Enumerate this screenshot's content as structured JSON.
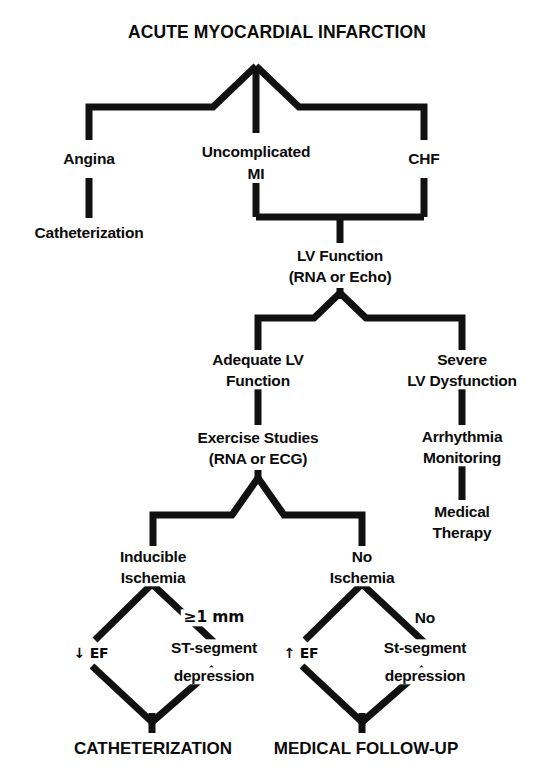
{
  "title": "ACUTE MYOCARDIAL INFARCTION",
  "diagram": {
    "type": "clinical-decision-flowchart",
    "stroke_color": "#111111",
    "background_color": "#ffffff",
    "nodes": {
      "root": "ACUTE MYOCARDIAL INFARCTION",
      "branch_angina": "Angina",
      "branch_uncomplicated_mi": "Uncomplicated\nMI",
      "branch_chf": "CHF",
      "angina_outcome": "Catheterization",
      "lv_function": "LV Function\n(RNA or Echo)",
      "adequate_lv": "Adequate LV\nFunction",
      "severe_lv": "Severe\nLV Dysfunction",
      "exercise_studies": "Exercise Studies\n(RNA or ECG)",
      "arrhythmia_monitoring": "Arrhythmia\nMonitoring",
      "medical_therapy": "Medical\nTherapy",
      "inducible_ischemia": "Inducible\nIschemia",
      "no_ischemia": "No\nIschemia",
      "low_ef": "↓ EF",
      "st_depression": "≥1 mm\nST-segment\ndepression",
      "high_ef": "↑ EF",
      "no_st_depression": "No\nSt-segment\ndepression",
      "terminal_catheterization": "CATHETERIZATION",
      "terminal_medical_followup": "MEDICAL FOLLOW-UP"
    },
    "labels": {
      "root": "ACUTE MYOCARDIAL INFARCTION",
      "angina": "Angina",
      "uncomplicated_mi_line1": "Uncomplicated",
      "uncomplicated_mi_line2": "MI",
      "chf": "CHF",
      "catheterization": "Catheterization",
      "lv_function_line1": "LV Function",
      "lv_function_line2": "(RNA or Echo)",
      "adequate_lv_line1": "Adequate LV",
      "adequate_lv_line2": "Function",
      "severe_lv_line1": "Severe",
      "severe_lv_line2": "LV Dysfunction",
      "exercise_line1": "Exercise Studies",
      "exercise_line2": "(RNA or ECG)",
      "arrhythmia_line1": "Arrhythmia",
      "arrhythmia_line2": "Monitoring",
      "medical_therapy_line1": "Medical",
      "medical_therapy_line2": "Therapy",
      "inducible_line1": "Inducible",
      "inducible_line2": "Ischemia",
      "no_ischemia_line1": "No",
      "no_ischemia_line2": "Ischemia",
      "low_ef": "↓ EF",
      "st_line1": "≥1 mm",
      "st_line2": "ST-segment",
      "st_line3": "depression",
      "high_ef": "↑ EF",
      "no_st_line1": "No",
      "no_st_line2": "St-segment",
      "no_st_line3": "depression",
      "terminal_left": "CATHETERIZATION",
      "terminal_right": "MEDICAL FOLLOW-UP"
    },
    "edges": [
      {
        "from": "root",
        "to": "branch_angina"
      },
      {
        "from": "root",
        "to": "branch_uncomplicated_mi"
      },
      {
        "from": "root",
        "to": "branch_chf"
      },
      {
        "from": "branch_angina",
        "to": "angina_outcome"
      },
      {
        "from": "branch_uncomplicated_mi",
        "to": "lv_function"
      },
      {
        "from": "branch_chf",
        "to": "lv_function"
      },
      {
        "from": "lv_function",
        "to": "adequate_lv"
      },
      {
        "from": "lv_function",
        "to": "severe_lv"
      },
      {
        "from": "adequate_lv",
        "to": "exercise_studies"
      },
      {
        "from": "severe_lv",
        "to": "arrhythmia_monitoring"
      },
      {
        "from": "arrhythmia_monitoring",
        "to": "medical_therapy"
      },
      {
        "from": "exercise_studies",
        "to": "inducible_ischemia"
      },
      {
        "from": "exercise_studies",
        "to": "no_ischemia"
      },
      {
        "from": "inducible_ischemia",
        "to": "low_ef"
      },
      {
        "from": "inducible_ischemia",
        "to": "st_depression"
      },
      {
        "from": "low_ef",
        "to": "terminal_catheterization"
      },
      {
        "from": "st_depression",
        "to": "terminal_catheterization"
      },
      {
        "from": "no_ischemia",
        "to": "high_ef"
      },
      {
        "from": "no_ischemia",
        "to": "no_st_depression"
      },
      {
        "from": "high_ef",
        "to": "terminal_medical_followup"
      },
      {
        "from": "no_st_depression",
        "to": "terminal_medical_followup"
      }
    ]
  }
}
